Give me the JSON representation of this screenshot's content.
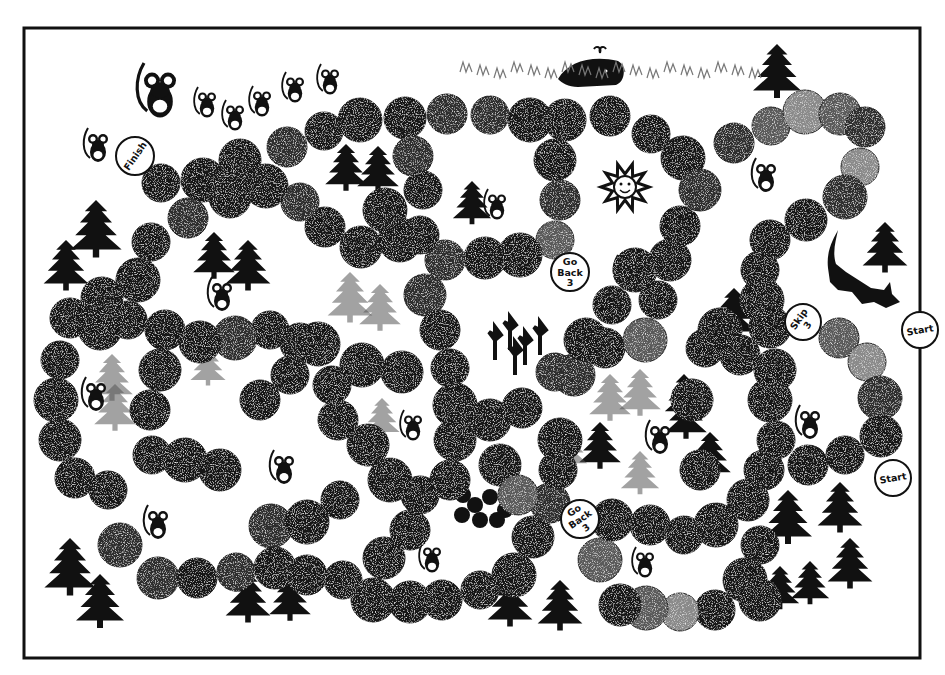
{
  "board": {
    "title": "Mouse path board game",
    "frame": {
      "x": 24,
      "y": 28,
      "width": 896,
      "height": 630,
      "color": "#111111"
    },
    "colors": {
      "space_dark": "#141414",
      "space_mid": "#2e2e2e",
      "space_gray": "#5a5a5a",
      "space_light": "#8a8a8a",
      "background": "#ffffff"
    }
  },
  "special_spaces": [
    {
      "id": "finish",
      "label": "Finish",
      "lines": [
        "Finish"
      ],
      "x": 135,
      "y": 156,
      "r": 19,
      "rotate": -55
    },
    {
      "id": "go-back-3-top",
      "label": "Go Back 3",
      "lines": [
        "Go",
        "Back",
        "3"
      ],
      "x": 570,
      "y": 272,
      "r": 19,
      "rotate": 0
    },
    {
      "id": "skip-3",
      "label": "Skip 3",
      "lines": [
        "Skip",
        "3"
      ],
      "x": 803,
      "y": 322,
      "r": 18,
      "rotate": -55
    },
    {
      "id": "start-top",
      "label": "Start",
      "lines": [
        "Start"
      ],
      "x": 920,
      "y": 330,
      "r": 18,
      "rotate": -10
    },
    {
      "id": "start-bottom",
      "label": "Start",
      "lines": [
        "Start"
      ],
      "x": 893,
      "y": 478,
      "r": 18,
      "rotate": -10
    },
    {
      "id": "go-back-3-bottom",
      "label": "Go Back 3",
      "lines": [
        "Go",
        "Back",
        "3"
      ],
      "x": 580,
      "y": 519,
      "r": 19,
      "rotate": -35
    }
  ],
  "spaces": [
    [
      161,
      183,
      "d"
    ],
    [
      203,
      180,
      "d"
    ],
    [
      240,
      160,
      "d"
    ],
    [
      287,
      147,
      "m"
    ],
    [
      324,
      131,
      "d"
    ],
    [
      360,
      120,
      "d"
    ],
    [
      405,
      118,
      "d"
    ],
    [
      447,
      114,
      "m"
    ],
    [
      490,
      115,
      "m"
    ],
    [
      530,
      120,
      "d"
    ],
    [
      565,
      120,
      "d"
    ],
    [
      610,
      116,
      "d"
    ],
    [
      651,
      134,
      "d"
    ],
    [
      683,
      158,
      "d"
    ],
    [
      700,
      190,
      "m"
    ],
    [
      734,
      143,
      "m"
    ],
    [
      771,
      126,
      "g"
    ],
    [
      805,
      112,
      "l"
    ],
    [
      840,
      114,
      "g"
    ],
    [
      865,
      127,
      "m"
    ],
    [
      860,
      167,
      "l"
    ],
    [
      845,
      197,
      "m"
    ],
    [
      806,
      220,
      "d"
    ],
    [
      770,
      240,
      "d"
    ],
    [
      760,
      270,
      "d"
    ],
    [
      762,
      300,
      "d"
    ],
    [
      770,
      327,
      "d"
    ],
    [
      839,
      338,
      "g"
    ],
    [
      867,
      362,
      "l"
    ],
    [
      880,
      398,
      "m"
    ],
    [
      881,
      436,
      "d"
    ],
    [
      413,
      156,
      "m"
    ],
    [
      423,
      190,
      "d"
    ],
    [
      385,
      210,
      "d"
    ],
    [
      361,
      247,
      "d"
    ],
    [
      325,
      227,
      "d"
    ],
    [
      300,
      202,
      "m"
    ],
    [
      266,
      186,
      "d"
    ],
    [
      230,
      197,
      "d"
    ],
    [
      188,
      218,
      "m"
    ],
    [
      151,
      242,
      "d"
    ],
    [
      138,
      280,
      "d"
    ],
    [
      102,
      298,
      "d"
    ],
    [
      70,
      318,
      "d"
    ],
    [
      60,
      360,
      "d"
    ],
    [
      56,
      400,
      "d"
    ],
    [
      60,
      440,
      "d"
    ],
    [
      75,
      478,
      "d"
    ],
    [
      108,
      490,
      "d"
    ],
    [
      120,
      545,
      "m"
    ],
    [
      158,
      578,
      "m"
    ],
    [
      197,
      578,
      "d"
    ],
    [
      236,
      572,
      "m"
    ],
    [
      271,
      526,
      "m"
    ],
    [
      275,
      568,
      "d"
    ],
    [
      307,
      575,
      "d"
    ],
    [
      343,
      580,
      "d"
    ],
    [
      373,
      600,
      "d"
    ],
    [
      410,
      602,
      "d"
    ],
    [
      442,
      600,
      "d"
    ],
    [
      480,
      590,
      "d"
    ],
    [
      514,
      575,
      "d"
    ],
    [
      533,
      537,
      "d"
    ],
    [
      550,
      503,
      "m"
    ],
    [
      558,
      470,
      "d"
    ],
    [
      560,
      440,
      "d"
    ],
    [
      574,
      375,
      "m"
    ],
    [
      605,
      348,
      "d"
    ],
    [
      612,
      305,
      "d"
    ],
    [
      635,
      270,
      "d"
    ],
    [
      670,
      260,
      "d"
    ],
    [
      680,
      226,
      "d"
    ],
    [
      658,
      300,
      "d"
    ],
    [
      645,
      340,
      "g"
    ],
    [
      555,
      160,
      "d"
    ],
    [
      560,
      200,
      "m"
    ],
    [
      555,
      240,
      "g"
    ],
    [
      520,
      255,
      "d"
    ],
    [
      485,
      258,
      "d"
    ],
    [
      445,
      260,
      "m"
    ],
    [
      420,
      235,
      "d"
    ],
    [
      400,
      240,
      "d"
    ],
    [
      425,
      295,
      "m"
    ],
    [
      440,
      330,
      "d"
    ],
    [
      450,
      368,
      "d"
    ],
    [
      455,
      405,
      "d"
    ],
    [
      455,
      440,
      "d"
    ],
    [
      450,
      480,
      "d"
    ],
    [
      420,
      495,
      "d"
    ],
    [
      390,
      480,
      "d"
    ],
    [
      368,
      445,
      "d"
    ],
    [
      338,
      420,
      "d"
    ],
    [
      332,
      385,
      "d"
    ],
    [
      362,
      365,
      "d"
    ],
    [
      402,
      372,
      "d"
    ],
    [
      300,
      343,
      "d"
    ],
    [
      270,
      330,
      "d"
    ],
    [
      235,
      338,
      "m"
    ],
    [
      200,
      342,
      "d"
    ],
    [
      165,
      330,
      "d"
    ],
    [
      128,
      320,
      "d"
    ],
    [
      100,
      328,
      "d"
    ],
    [
      160,
      370,
      "d"
    ],
    [
      150,
      410,
      "d"
    ],
    [
      152,
      455,
      "d"
    ],
    [
      185,
      460,
      "d"
    ],
    [
      220,
      470,
      "d"
    ],
    [
      260,
      400,
      "d"
    ],
    [
      290,
      375,
      "d"
    ],
    [
      318,
      344,
      "d"
    ],
    [
      490,
      420,
      "d"
    ],
    [
      522,
      408,
      "d"
    ],
    [
      555,
      372,
      "m"
    ],
    [
      586,
      340,
      "d"
    ],
    [
      500,
      465,
      "d"
    ],
    [
      518,
      495,
      "g"
    ],
    [
      340,
      500,
      "d"
    ],
    [
      307,
      522,
      "d"
    ],
    [
      384,
      558,
      "d"
    ],
    [
      410,
      530,
      "d"
    ],
    [
      374,
      600,
      "d"
    ],
    [
      600,
      560,
      "g"
    ],
    [
      612,
      520,
      "d"
    ],
    [
      650,
      525,
      "d"
    ],
    [
      684,
      535,
      "d"
    ],
    [
      716,
      525,
      "d"
    ],
    [
      748,
      500,
      "d"
    ],
    [
      764,
      470,
      "d"
    ],
    [
      776,
      440,
      "d"
    ],
    [
      770,
      400,
      "d"
    ],
    [
      775,
      370,
      "d"
    ],
    [
      740,
      355,
      "d"
    ],
    [
      705,
      348,
      "d"
    ],
    [
      720,
      330,
      "d"
    ],
    [
      692,
      400,
      "d"
    ],
    [
      700,
      470,
      "d"
    ],
    [
      760,
      545,
      "d"
    ],
    [
      745,
      580,
      "d"
    ],
    [
      760,
      600,
      "d"
    ],
    [
      715,
      610,
      "d"
    ],
    [
      680,
      612,
      "l"
    ],
    [
      646,
      608,
      "g"
    ],
    [
      620,
      605,
      "d"
    ],
    [
      808,
      465,
      "d"
    ],
    [
      845,
      455,
      "d"
    ]
  ],
  "illustrations": {
    "sun": {
      "x": 625,
      "y": 187,
      "label": "sun-face"
    },
    "cat": {
      "x": 856,
      "y": 280
    },
    "whale": {
      "x": 598,
      "y": 75
    },
    "mice": [
      {
        "x": 98,
        "y": 148,
        "s": 1.0
      },
      {
        "x": 160,
        "y": 95,
        "s": 1.6
      },
      {
        "x": 207,
        "y": 105,
        "s": 0.9
      },
      {
        "x": 235,
        "y": 118,
        "s": 0.9
      },
      {
        "x": 262,
        "y": 104,
        "s": 0.9
      },
      {
        "x": 295,
        "y": 90,
        "s": 0.9
      },
      {
        "x": 330,
        "y": 82,
        "s": 0.9
      },
      {
        "x": 497,
        "y": 207,
        "s": 0.9
      },
      {
        "x": 766,
        "y": 178,
        "s": 1.0
      },
      {
        "x": 628,
        "y": 275,
        "s": 1.0
      },
      {
        "x": 222,
        "y": 297,
        "s": 1.0
      },
      {
        "x": 96,
        "y": 397,
        "s": 1.0
      },
      {
        "x": 284,
        "y": 470,
        "s": 1.0
      },
      {
        "x": 413,
        "y": 428,
        "s": 0.9
      },
      {
        "x": 660,
        "y": 440,
        "s": 1.0
      },
      {
        "x": 810,
        "y": 425,
        "s": 1.0
      },
      {
        "x": 158,
        "y": 525,
        "s": 1.0
      },
      {
        "x": 432,
        "y": 560,
        "s": 0.9
      },
      {
        "x": 645,
        "y": 565,
        "s": 0.9
      }
    ],
    "trees_dark": [
      [
        777,
        74,
        30
      ],
      [
        885,
        250,
        28
      ],
      [
        96,
        232,
        32
      ],
      [
        66,
        268,
        28
      ],
      [
        214,
        258,
        26
      ],
      [
        248,
        268,
        28
      ],
      [
        346,
        170,
        26
      ],
      [
        378,
        172,
        26
      ],
      [
        472,
        205,
        24
      ],
      [
        734,
        316,
        28
      ],
      [
        600,
        448,
        26
      ],
      [
        686,
        418,
        26
      ],
      [
        710,
        458,
        26
      ],
      [
        684,
        398,
        24
      ],
      [
        788,
        520,
        30
      ],
      [
        840,
        510,
        28
      ],
      [
        850,
        566,
        28
      ],
      [
        70,
        570,
        32
      ],
      [
        100,
        604,
        30
      ],
      [
        248,
        600,
        28
      ],
      [
        290,
        600,
        26
      ],
      [
        510,
        604,
        28
      ],
      [
        560,
        608,
        28
      ],
      [
        780,
        590,
        24
      ],
      [
        810,
        585,
        24
      ]
    ],
    "trees_light": [
      [
        350,
        300,
        28
      ],
      [
        380,
        310,
        26
      ],
      [
        112,
        380,
        26
      ],
      [
        115,
        410,
        26
      ],
      [
        208,
        368,
        22
      ],
      [
        382,
        420,
        22
      ],
      [
        568,
        450,
        24
      ],
      [
        610,
        400,
        26
      ],
      [
        640,
        395,
        26
      ],
      [
        640,
        475,
        24
      ]
    ]
  }
}
